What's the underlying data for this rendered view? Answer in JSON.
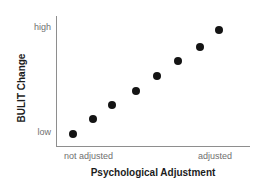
{
  "chart_data": {
    "type": "scatter",
    "title": "",
    "subtitle": "",
    "xlabel": "Psychological Adjustment",
    "ylabel": "BULIT Change",
    "grid": false,
    "legend": null,
    "legend_position": "none",
    "point_color": "#141414",
    "axis_color": "#8e8e8e",
    "tick_label_color": "#6f6f6f",
    "axis_title_color": "#1c1c1c",
    "x_tick_labels": [
      "not adjusted",
      "adjusted"
    ],
    "y_tick_labels": [
      "low",
      "high"
    ],
    "xlim": [
      0,
      1
    ],
    "ylim": [
      0,
      1
    ],
    "x": [
      0.09,
      0.19,
      0.29,
      0.41,
      0.52,
      0.63,
      0.74,
      0.84
    ],
    "y": [
      0.1,
      0.21,
      0.32,
      0.43,
      0.54,
      0.66,
      0.76,
      0.89
    ],
    "points": [
      {
        "x": 0.09,
        "y": 0.1
      },
      {
        "x": 0.19,
        "y": 0.21
      },
      {
        "x": 0.29,
        "y": 0.32
      },
      {
        "x": 0.41,
        "y": 0.43
      },
      {
        "x": 0.52,
        "y": 0.54
      },
      {
        "x": 0.63,
        "y": 0.66
      },
      {
        "x": 0.74,
        "y": 0.76
      },
      {
        "x": 0.84,
        "y": 0.89
      }
    ],
    "annotations": []
  },
  "axes": {
    "y_title": "BULIT Change",
    "x_title": "Psychological Adjustment",
    "y_tick_high": "high",
    "y_tick_low": "low",
    "x_tick_left": "not adjusted",
    "x_tick_right": "adjusted"
  }
}
